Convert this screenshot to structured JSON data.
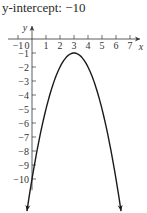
{
  "caption": "y-intercept: −10",
  "chart_data": {
    "type": "line",
    "title": "",
    "function": "y = -(x - 3)^2 - 1",
    "xlabel": "x",
    "ylabel": "y",
    "xlim": [
      -1,
      7
    ],
    "ylim": [
      -10,
      0
    ],
    "x_ticks": [
      "−1",
      "0",
      "1",
      "2",
      "3",
      "4",
      "5",
      "6",
      "7"
    ],
    "y_ticks": [
      "−1",
      "−2",
      "−3",
      "−4",
      "−5",
      "−6",
      "−7",
      "−8",
      "−9",
      "−10"
    ],
    "vertex": [
      3,
      -1
    ],
    "series": [
      {
        "name": "parabola",
        "x": [
          -0.35,
          0,
          1,
          2,
          3,
          4,
          5,
          6,
          6.35
        ],
        "y": [
          -12.2,
          -10,
          -5,
          -2,
          -1,
          -2,
          -5,
          -10,
          -12.2
        ]
      }
    ],
    "grid": false,
    "legend": null
  }
}
